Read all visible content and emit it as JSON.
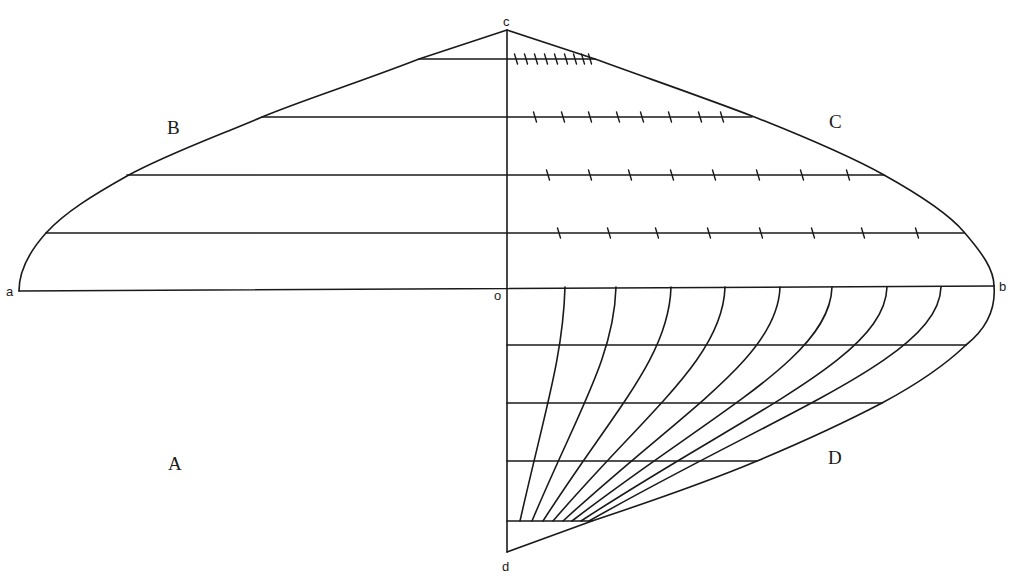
{
  "diagram": {
    "title": "",
    "point_labels": [
      {
        "id": "a",
        "text": "a",
        "x": 6,
        "y": 296
      },
      {
        "id": "b",
        "text": "b",
        "x": 999,
        "y": 291
      },
      {
        "id": "c",
        "text": "c",
        "x": 503,
        "y": 26
      },
      {
        "id": "o",
        "text": "o",
        "x": 494,
        "y": 300
      },
      {
        "id": "d",
        "text": "d",
        "x": 502,
        "y": 571
      }
    ],
    "region_labels": [
      {
        "id": "A",
        "text": "A",
        "x": 168,
        "y": 470
      },
      {
        "id": "B",
        "text": "B",
        "x": 167,
        "y": 134
      },
      {
        "id": "C",
        "text": "C",
        "x": 829,
        "y": 128
      },
      {
        "id": "D",
        "text": "D",
        "x": 828,
        "y": 464
      }
    ],
    "colors": {
      "ink": "#1a1a1a",
      "background": "#ffffff"
    },
    "axes": {
      "vertical_co_d": {
        "x": 507,
        "top": 30,
        "bottom": 552
      },
      "horizontal_a_b": {
        "x1": 19,
        "y1": 291,
        "x2": 994,
        "y2": 286
      }
    },
    "upper_horizontals": [
      {
        "y": 59,
        "left_x": 419,
        "right_x": 595,
        "ticks": [
          516,
          526,
          536,
          546,
          556,
          566,
          575,
          583,
          590
        ]
      },
      {
        "y": 117,
        "left_x": 262,
        "right_x": 752,
        "ticks": [
          535,
          563,
          590,
          618,
          642,
          670,
          700,
          722
        ]
      },
      {
        "y": 175,
        "left_x": 127,
        "right_x": 884,
        "ticks": [
          548,
          590,
          630,
          672,
          714,
          758,
          802,
          848
        ]
      },
      {
        "y": 233,
        "left_x": 46,
        "right_x": 964,
        "ticks": [
          559,
          609,
          657,
          709,
          761,
          813,
          863,
          917
        ]
      }
    ],
    "lower_horizontals": [
      {
        "y": 345,
        "right_x": 966
      },
      {
        "y": 403,
        "right_x": 882
      },
      {
        "y": 461,
        "right_x": 757
      },
      {
        "y": 521,
        "right_x": 592
      }
    ],
    "lower_arcs": [
      {
        "top_x": 565,
        "bottom_x": 520
      },
      {
        "top_x": 616,
        "bottom_x": 532
      },
      {
        "top_x": 671,
        "bottom_x": 543
      },
      {
        "top_x": 725,
        "bottom_x": 553
      },
      {
        "top_x": 780,
        "bottom_x": 563
      },
      {
        "top_x": 832,
        "bottom_x": 572
      },
      {
        "top_x": 887,
        "bottom_x": 581
      },
      {
        "top_x": 941,
        "bottom_x": 589
      }
    ]
  }
}
